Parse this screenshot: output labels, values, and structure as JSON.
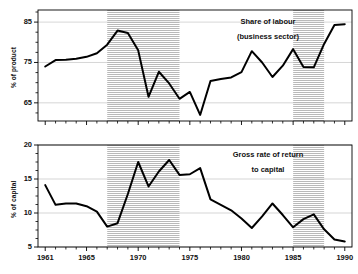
{
  "figure": {
    "background": "#ffffff",
    "line_color": "#000000",
    "band_color": "#cccccc",
    "frame_color": "#000000",
    "grid_color": "#bbbbbb"
  },
  "chart_data": [
    {
      "type": "line",
      "id": "share-of-labour",
      "title": "Share of labour",
      "subtitle": "(business sector)",
      "xlabel": "",
      "ylabel": "% of product",
      "xlim": [
        1960.3,
        1990.7
      ],
      "ylim": [
        60.5,
        88.0
      ],
      "yticks": [
        65,
        75,
        85
      ],
      "yticklabels": [
        "65",
        "75",
        "85"
      ],
      "yminorticks": [
        62.5,
        67.5,
        70,
        72.5,
        77.5,
        80,
        82.5,
        87.5
      ],
      "xticks": [
        1961,
        1965,
        1970,
        1975,
        1980,
        1985,
        1990
      ],
      "xticklabels": [
        "1961",
        "1965",
        "1970",
        "1975",
        "1980",
        "1985",
        "1990"
      ],
      "grid": "horizontal",
      "legend": "none",
      "shaded_bands": [
        {
          "start": 1967,
          "end": 1974
        },
        {
          "start": 1985,
          "end": 1988
        }
      ],
      "x": [
        1961,
        1962,
        1963,
        1964,
        1965,
        1966,
        1967,
        1968,
        1969,
        1970,
        1971,
        1972,
        1973,
        1974,
        1975,
        1976,
        1977,
        1978,
        1979,
        1980,
        1981,
        1982,
        1983,
        1984,
        1985,
        1986,
        1987,
        1988,
        1989,
        1990
      ],
      "values": [
        74.0,
        75.6,
        75.7,
        75.9,
        76.4,
        77.3,
        79.4,
        82.9,
        82.3,
        78.0,
        66.5,
        72.7,
        69.8,
        66.0,
        67.7,
        62.0,
        70.4,
        70.9,
        71.3,
        72.6,
        77.8,
        75.0,
        71.4,
        74.2,
        78.3,
        73.9,
        73.8,
        79.6,
        84.3,
        84.5,
        80.8
      ]
    },
    {
      "type": "line",
      "id": "gross-rate-of-return",
      "title": "Gross rate of return",
      "subtitle": "to capital",
      "xlabel": "",
      "ylabel": "% of capital",
      "xlim": [
        1960.3,
        1990.7
      ],
      "ylim": [
        5.0,
        20.0
      ],
      "yticks": [
        5,
        10,
        15,
        20
      ],
      "yticklabels": [
        "5",
        "10",
        "15",
        "20"
      ],
      "yminorticks": [
        6.25,
        7.5,
        8.75,
        11.25,
        12.5,
        13.75,
        16.25,
        17.5,
        18.75
      ],
      "xticks": [
        1961,
        1965,
        1970,
        1975,
        1980,
        1985,
        1990
      ],
      "xticklabels": [
        "1961",
        "1965",
        "1970",
        "1975",
        "1980",
        "1985",
        "1990"
      ],
      "grid": "horizontal",
      "legend": "none",
      "shaded_bands": [
        {
          "start": 1967,
          "end": 1974
        },
        {
          "start": 1985,
          "end": 1988
        }
      ],
      "x": [
        1961,
        1962,
        1963,
        1964,
        1965,
        1966,
        1967,
        1968,
        1969,
        1970,
        1971,
        1972,
        1973,
        1974,
        1975,
        1976,
        1977,
        1978,
        1979,
        1980,
        1981,
        1982,
        1983,
        1984,
        1985,
        1986,
        1987,
        1988,
        1989,
        1990
      ],
      "values": [
        14.1,
        11.2,
        11.4,
        11.4,
        11.0,
        10.2,
        8.0,
        8.5,
        12.8,
        17.5,
        13.9,
        16.1,
        17.8,
        15.6,
        15.7,
        16.6,
        12.0,
        11.2,
        10.4,
        9.2,
        7.8,
        9.5,
        11.4,
        9.7,
        7.9,
        9.1,
        9.8,
        7.6,
        6.1,
        5.8,
        7.3
      ]
    }
  ]
}
